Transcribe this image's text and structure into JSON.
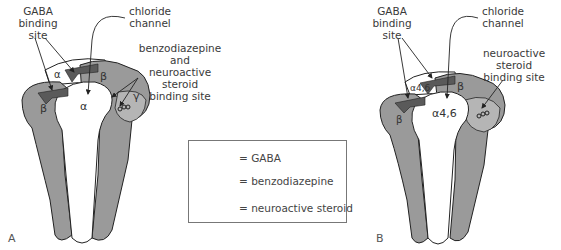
{
  "panels": [
    {
      "id": "A",
      "label": "A",
      "callouts": {
        "gaba_site": "GABA\nbinding site",
        "chloride": "chloride\nchannel",
        "bzd_steroid": "benzodiazepine and\nneuroactive steroid\nbinding site"
      },
      "subunits": [
        "α",
        "β",
        "α",
        "β",
        "γ"
      ]
    },
    {
      "id": "B",
      "label": "B",
      "callouts": {
        "gaba_site": "GABA\nbinding site",
        "chloride": "chloride\nchannel",
        "steroid": "neuroactive steroid\nbinding site"
      },
      "subunits": [
        "α4,6",
        "β",
        "α4,6",
        "β"
      ]
    }
  ],
  "legend": {
    "items": [
      {
        "icon": "gaba-wedge-icon",
        "label": "= GABA"
      },
      {
        "icon": "benzodiazepine-icon",
        "label": "= benzodiazepine"
      },
      {
        "icon": "neuroactive-steroid-icon",
        "label": "= neuroactive steroid"
      }
    ]
  },
  "colors": {
    "subunit_fill": "#9a9a9a",
    "subunit_light": "#b5b5b5",
    "gaba_fill": "#5a5a5a",
    "outline": "#222222",
    "pore": "#ffffff"
  }
}
